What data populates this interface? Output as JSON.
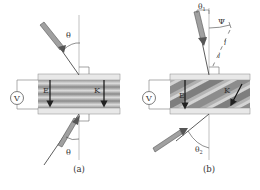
{
  "figure": {
    "panels": [
      {
        "id": "a",
        "caption": "(a)",
        "labels": {
          "voltmeter": "V",
          "field_left": "E",
          "field_right": "K",
          "angle_top": "θ",
          "angle_bottom": "θ"
        }
      },
      {
        "id": "b",
        "caption": "(b)",
        "labels": {
          "voltmeter": "V",
          "field_left": "E",
          "field_right": "K",
          "angle_incident": "θ1",
          "angle_incident_base": "θ",
          "angle_incident_sub": "1",
          "angle_psi": "Ψ",
          "length_1": "l",
          "length_2": "l",
          "angle_exit": "θ2",
          "angle_exit_base": "θ",
          "angle_exit_sub": "2"
        }
      }
    ],
    "colors": {
      "line": "#555555",
      "stripe_dark": "#8a8a8a",
      "stripe_light": "#d8d8d8",
      "plate": "#e6e6e6",
      "beam_fill": "#9a9a9a",
      "beam_edge": "#555555"
    }
  }
}
